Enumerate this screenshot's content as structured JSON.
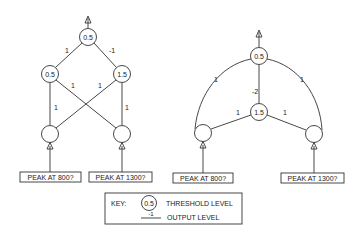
{
  "networks": [
    {
      "name": "crossed-network",
      "output_node": {
        "threshold": "0.5"
      },
      "hidden_nodes": [
        {
          "threshold": "0.5"
        },
        {
          "threshold": "1.5"
        }
      ],
      "weights": {
        "left_to_output": "1",
        "right_to_output": "-1",
        "in1_to_h1": "1",
        "in1_to_h2": "1",
        "in2_to_h1": "1",
        "in2_to_h2": "1"
      },
      "inputs": [
        {
          "label": "PEAK AT 800?"
        },
        {
          "label": "PEAK AT 1300?"
        }
      ]
    },
    {
      "name": "arched-network",
      "output_node": {
        "threshold": "0.5"
      },
      "hidden_node": {
        "threshold": "1.5"
      },
      "weights": {
        "in1_to_output": "1",
        "in2_to_output": "1",
        "hidden_to_output": "-2",
        "in1_to_hidden": "1",
        "in2_to_hidden": "1"
      },
      "inputs": [
        {
          "label": "PEAK AT 800?"
        },
        {
          "label": "PEAK AT 1300?"
        }
      ]
    }
  ],
  "key": {
    "title": "KEY:",
    "threshold_example": "0.5",
    "threshold_label": "THRESHOLD LEVEL",
    "output_example": "-1",
    "output_label": "OUTPUT LEVEL"
  }
}
